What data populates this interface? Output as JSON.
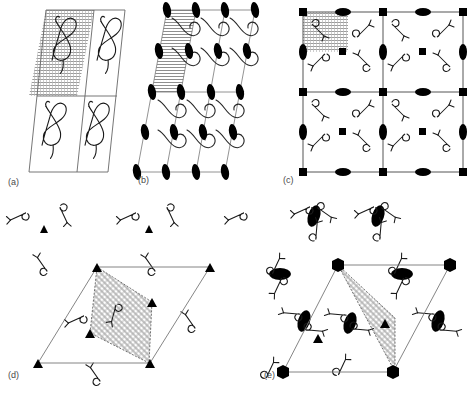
{
  "figure": {
    "background_color": "#ffffff",
    "line_color": "#555555",
    "symbol_color": "#000000",
    "hatch_color": "#8a8a8a",
    "label_color": "#4a4a4a",
    "width": 468,
    "height": 394
  },
  "panels": [
    {
      "id": "a",
      "label": "(a)",
      "lattice": "oblique",
      "motif": "treble-clef-curl",
      "motif_count": 4,
      "cells": 4,
      "shaded_cell": "top-left",
      "symmetry_symbols": [],
      "symbol_counts": {
        "ellipse": 0,
        "square": 0,
        "triangle": 0,
        "hexagon": 0
      },
      "label_pos": {
        "x": 8,
        "y": 185
      }
    },
    {
      "id": "b",
      "label": "(b)",
      "lattice": "oblique-p2",
      "motif": "s-curve-clef",
      "motif_count": 12,
      "cells": 6,
      "shaded_cell": "top-left-strip",
      "symmetry_symbols": [
        "two-fold-ellipse"
      ],
      "symbol_counts": {
        "ellipse": 25,
        "square": 0,
        "triangle": 0,
        "hexagon": 0
      },
      "label_pos": {
        "x": 138,
        "y": 183
      }
    },
    {
      "id": "c",
      "label": "(c)",
      "lattice": "rectangular-p4",
      "motif": "y-fork-curl",
      "motif_count": 16,
      "cells": 4,
      "shaded_cell": "top-left",
      "symmetry_symbols": [
        "four-fold-square",
        "two-fold-ellipse"
      ],
      "symbol_counts": {
        "ellipse": 16,
        "square": 13,
        "triangle": 0,
        "hexagon": 0
      },
      "label_pos": {
        "x": 283,
        "y": 183
      }
    },
    {
      "id": "d",
      "label": "(d)",
      "lattice": "hexagonal-p3",
      "motif": "loop-key",
      "motif_count": 12,
      "cells": 1,
      "shaded_cell": "asymmetric-unit",
      "symmetry_symbols": [
        "three-fold-triangle"
      ],
      "symbol_counts": {
        "ellipse": 0,
        "square": 0,
        "triangle": 9,
        "hexagon": 0
      },
      "label_pos": {
        "x": 8,
        "y": 378
      }
    },
    {
      "id": "e",
      "label": "(e)",
      "lattice": "hexagonal-p6",
      "motif": "loop-key-cluster",
      "motif_count": 14,
      "cells": 1,
      "shaded_cell": "asymmetric-unit-wedge",
      "symmetry_symbols": [
        "six-fold-hexagon",
        "three-fold-triangle",
        "two-fold-ellipse"
      ],
      "symbol_counts": {
        "ellipse": 8,
        "square": 0,
        "triangle": 2,
        "hexagon": 4
      },
      "label_pos": {
        "x": 264,
        "y": 378
      }
    }
  ],
  "legend": {
    "two_fold": "two-fold rotation axis (filled ellipse)",
    "three_fold": "three-fold rotation axis (filled triangle)",
    "four_fold": "four-fold rotation axis (filled square)",
    "six_fold": "six-fold rotation axis (filled hexagon)"
  }
}
